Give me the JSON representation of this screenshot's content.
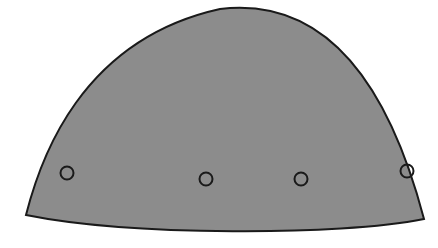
{
  "diagram": {
    "shape": {
      "kind": "dome",
      "fill": "#8c8c8c",
      "stroke": "#1a1a1a",
      "stroke_width": 2
    },
    "markers": [
      {
        "id": "marker-1",
        "cx": 67,
        "cy": 173,
        "r": 6.5
      },
      {
        "id": "marker-2",
        "cx": 206,
        "cy": 179,
        "r": 6.5
      },
      {
        "id": "marker-3",
        "cx": 301,
        "cy": 179,
        "r": 6.5
      },
      {
        "id": "marker-4",
        "cx": 407,
        "cy": 171,
        "r": 6.5
      }
    ],
    "marker_style": {
      "fill": "none",
      "stroke": "#1a1a1a",
      "stroke_width": 2
    }
  }
}
